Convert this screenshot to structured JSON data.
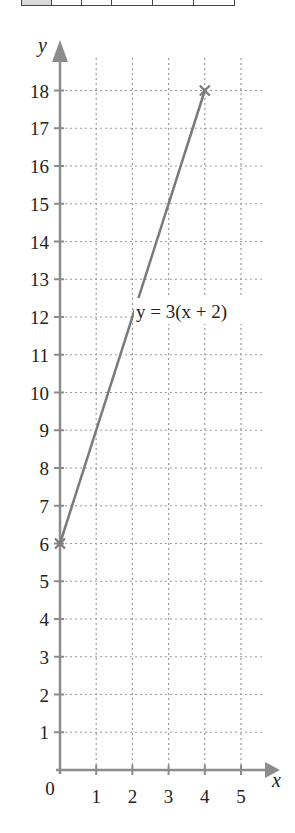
{
  "top_table": {
    "cells": 6,
    "widths": [
      29,
      29,
      29,
      40,
      40,
      40
    ]
  },
  "chart_data": {
    "type": "line",
    "title": "",
    "xlabel": "x",
    "ylabel": "y",
    "origin_label": "0",
    "xlim": [
      0,
      5
    ],
    "ylim": [
      0,
      18
    ],
    "x_ticks": [
      "1",
      "2",
      "3",
      "4",
      "5"
    ],
    "y_ticks": [
      "1",
      "2",
      "3",
      "4",
      "5",
      "6",
      "7",
      "8",
      "9",
      "10",
      "11",
      "12",
      "13",
      "14",
      "15",
      "16",
      "17",
      "18"
    ],
    "grid": true,
    "grid_style": "dotted",
    "series": [
      {
        "name": "y = 3(x + 2)",
        "x": [
          0,
          4
        ],
        "y": [
          6,
          18
        ],
        "markers": "x",
        "color": "#7a7a7a"
      }
    ],
    "annotations": [
      {
        "text": "y = 3(x + 2)",
        "x": 2.1,
        "y": 11.8
      }
    ]
  },
  "colors": {
    "axis": "#8c8c8c",
    "grid": "#9a9a9a",
    "line": "#7a7a7a",
    "text": "#222222"
  }
}
